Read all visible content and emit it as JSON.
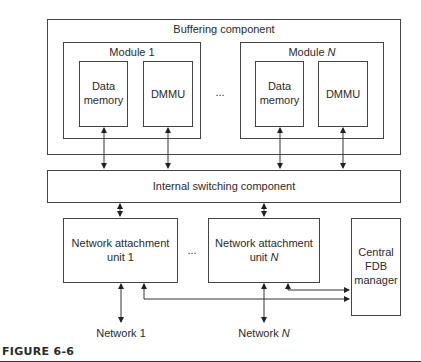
{
  "diagram": {
    "buffering": {
      "label": "Buffering component"
    },
    "modules": [
      {
        "label_prefix": "Module ",
        "label_index": "1",
        "data_memory": [
          "Data",
          "memory"
        ],
        "dmmu": "DMMU"
      },
      {
        "label_prefix": "Module ",
        "label_index": "N",
        "data_memory": [
          "Data",
          "memory"
        ],
        "dmmu": "DMMU"
      }
    ],
    "module_ellipsis": "...",
    "switching": {
      "label": "Internal switching component"
    },
    "nau": [
      {
        "line1": "Network attachment",
        "line2_prefix": "unit ",
        "line2_index": "1"
      },
      {
        "line1": "Network attachment",
        "line2_prefix": "unit ",
        "line2_index": "N"
      }
    ],
    "nau_ellipsis": "...",
    "fdb": {
      "lines": [
        "Central",
        "FDB",
        "manager"
      ]
    },
    "networks": [
      {
        "prefix": "Network ",
        "index": "1"
      },
      {
        "prefix": "Network ",
        "index": "N"
      }
    ]
  },
  "caption": {
    "label": "FIGURE 6-6"
  }
}
